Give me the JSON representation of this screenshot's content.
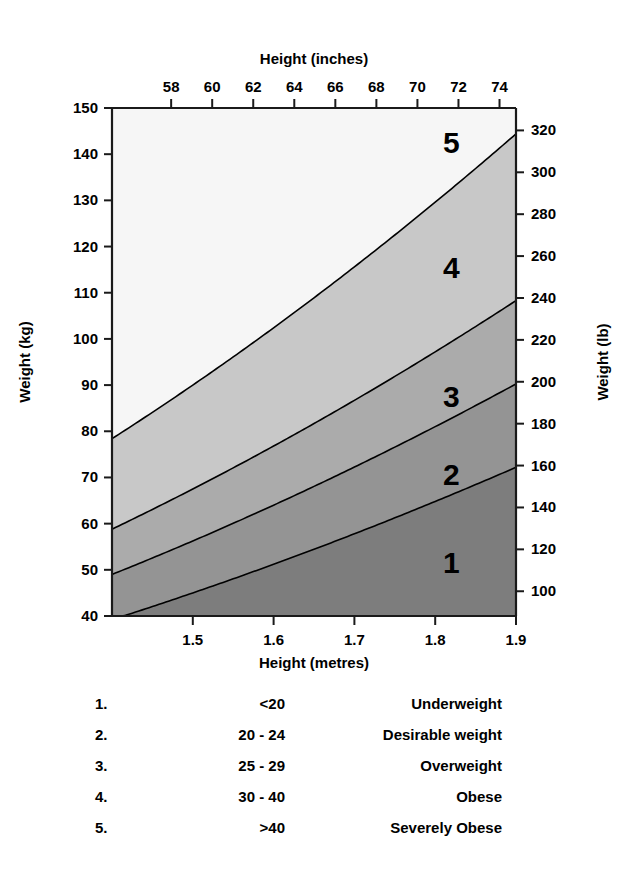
{
  "chart_data": {
    "type": "area",
    "title": "",
    "xlabel": "Height (metres)",
    "ylabel": "Weight (kg)",
    "x2label": "Height (inches)",
    "y2label": "Weight (lb)",
    "xlim": [
      1.4,
      1.9
    ],
    "ylim": [
      40,
      150
    ],
    "x2lim": [
      55.12,
      74.8
    ],
    "y2lim": [
      88.18,
      330.69
    ],
    "grid": false,
    "legend_position": "below-plot",
    "x_ticks": [
      "1.5",
      "1.6",
      "1.7",
      "1.8",
      "1.9"
    ],
    "x_tick_values": [
      1.5,
      1.6,
      1.7,
      1.8,
      1.9
    ],
    "y_ticks": [
      "40",
      "50",
      "60",
      "70",
      "80",
      "90",
      "100",
      "110",
      "120",
      "130",
      "140",
      "150"
    ],
    "y_tick_values": [
      40,
      50,
      60,
      70,
      80,
      90,
      100,
      110,
      120,
      130,
      140,
      150
    ],
    "x2_ticks": [
      "58",
      "60",
      "62",
      "64",
      "66",
      "68",
      "70",
      "72",
      "74"
    ],
    "x2_tick_values": [
      58,
      60,
      62,
      64,
      66,
      68,
      70,
      72,
      74
    ],
    "y2_ticks": [
      "100",
      "120",
      "140",
      "160",
      "180",
      "200",
      "220",
      "240",
      "260",
      "280",
      "300",
      "320"
    ],
    "y2_tick_values": [
      100,
      120,
      140,
      160,
      180,
      200,
      220,
      240,
      260,
      280,
      300,
      320
    ],
    "boundaries": [
      {
        "bmi": 20,
        "label": "BMI 20",
        "formula": "weight = 20 x height^2"
      },
      {
        "bmi": 25,
        "label": "BMI 25",
        "formula": "weight = 25 x height^2"
      },
      {
        "bmi": 30,
        "label": "BMI 30",
        "formula": "weight = 30 x height^2"
      },
      {
        "bmi": 40,
        "label": "BMI 40",
        "formula": "weight = 40 x height^2"
      }
    ],
    "bands": [
      {
        "id": "1",
        "bmi_min": 0,
        "bmi_max": 20,
        "color": "#7d7d7d",
        "label": "Underweight"
      },
      {
        "id": "2",
        "bmi_min": 20,
        "bmi_max": 25,
        "color": "#949494",
        "label": "Desirable weight"
      },
      {
        "id": "3",
        "bmi_min": 25,
        "bmi_max": 30,
        "color": "#ababab",
        "label": "Overweight"
      },
      {
        "id": "4",
        "bmi_min": 30,
        "bmi_max": 40,
        "color": "#c8c8c8",
        "label": "Obese"
      },
      {
        "id": "5",
        "bmi_min": 40,
        "bmi_max": 999,
        "color": "#f6f6f6",
        "label": "Severely Obese"
      }
    ],
    "region_labels": [
      {
        "text": "1",
        "height_m": 1.82,
        "weight_kg": 51
      },
      {
        "text": "2",
        "height_m": 1.82,
        "weight_kg": 70
      },
      {
        "text": "3",
        "height_m": 1.82,
        "weight_kg": 87
      },
      {
        "text": "4",
        "height_m": 1.82,
        "weight_kg": 115
      },
      {
        "text": "5",
        "height_m": 1.82,
        "weight_kg": 142
      }
    ],
    "axis_color": "#1a1a1a",
    "boundary_line_color": "#000000"
  },
  "legend": {
    "rows": [
      {
        "num": "1.",
        "range": "<20",
        "label": "Underweight"
      },
      {
        "num": "2.",
        "range": "20 - 24",
        "label": "Desirable weight"
      },
      {
        "num": "3.",
        "range": "25 - 29",
        "label": "Overweight"
      },
      {
        "num": "4.",
        "range": "30 - 40",
        "label": "Obese"
      },
      {
        "num": "5.",
        "range": ">40",
        "label": "Severely Obese"
      }
    ]
  }
}
